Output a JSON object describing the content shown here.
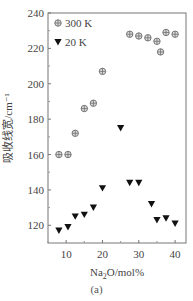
{
  "chart_data": {
    "type": "scatter",
    "title": "",
    "xlabel": "Na2O/mol%",
    "ylabel": "吸收线宽/cm⁻¹",
    "xlim": [
      5,
      43
    ],
    "ylim": [
      110,
      240
    ],
    "xticks": [
      10,
      20,
      30,
      40
    ],
    "yticks": [
      120,
      140,
      160,
      180,
      200,
      220,
      240
    ],
    "legend_position": "upper left",
    "grid": false,
    "series": [
      {
        "name": "300 K",
        "marker": "circle-cross",
        "color": "#888888",
        "x": [
          8,
          10.5,
          12.5,
          15,
          17.5,
          20,
          27.5,
          30,
          32.5,
          35,
          36,
          37.5,
          40
        ],
        "y": [
          160,
          160,
          172,
          186,
          189,
          207,
          228,
          227,
          226,
          224,
          218,
          229,
          228
        ]
      },
      {
        "name": "20 K",
        "marker": "triangle-down",
        "color": "#111111",
        "x": [
          8,
          10.5,
          12.5,
          15,
          17.5,
          20,
          25,
          27.5,
          30,
          33.5,
          35,
          37.5,
          40
        ],
        "y": [
          117,
          119,
          125,
          126,
          130,
          141,
          175,
          144,
          144,
          132,
          123,
          124,
          121
        ]
      }
    ],
    "caption": "(a)"
  },
  "labels": {
    "xlabel_main": "Na",
    "xlabel_sub": "2",
    "xlabel_rest": "O/mol%",
    "ylabel": "吸收线宽/cm⁻¹",
    "legend_300": "300 K",
    "legend_20": "20 K",
    "caption": "(a)"
  }
}
